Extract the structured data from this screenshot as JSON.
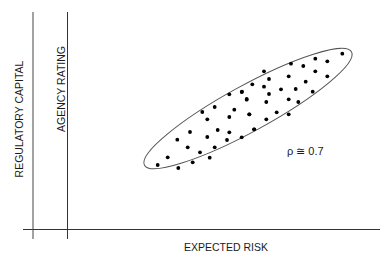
{
  "labels": {
    "x_axis": "EXPECTED RISK",
    "y_axis_1": "REGULATORY CAPITAL",
    "y_axis_2": "AGENCY RATING",
    "correlation": "ρ ≅ 0.7"
  },
  "colors": {
    "line": "#333333",
    "dot": "#000000",
    "ellipse": "#555555"
  },
  "points": [
    [
      157.7,
      165
    ],
    [
      167.7,
      157.3
    ],
    [
      178.3,
      168
    ],
    [
      192.7,
      162.3
    ],
    [
      177.3,
      139.7
    ],
    [
      187.7,
      147.3
    ],
    [
      190,
      132
    ],
    [
      200,
      152.3
    ],
    [
      209.7,
      157.7
    ],
    [
      214.7,
      147.3
    ],
    [
      207.3,
      137
    ],
    [
      202.3,
      112
    ],
    [
      207.3,
      119.3
    ],
    [
      214.7,
      107
    ],
    [
      217.7,
      130
    ],
    [
      227,
      140
    ],
    [
      229.3,
      132.3
    ],
    [
      229.3,
      117
    ],
    [
      234.3,
      109.7
    ],
    [
      229.3,
      94.3
    ],
    [
      241.7,
      92
    ],
    [
      246.7,
      99.7
    ],
    [
      249.3,
      114.3
    ],
    [
      241.7,
      137.3
    ],
    [
      254,
      129.3
    ],
    [
      342.3,
      53.7
    ],
    [
      327.3,
      61.3
    ],
    [
      315.3,
      58.7
    ],
    [
      303.3,
      66
    ],
    [
      291,
      63.7
    ],
    [
      315.3,
      71.3
    ],
    [
      327.3,
      76.3
    ],
    [
      264,
      71.3
    ],
    [
      269,
      79
    ],
    [
      288.7,
      76.3
    ],
    [
      305.7,
      81.7
    ],
    [
      252.3,
      84.3
    ],
    [
      242,
      91.7
    ],
    [
      264,
      86.7
    ],
    [
      281,
      89.3
    ],
    [
      295.7,
      89
    ],
    [
      312.7,
      91.7
    ],
    [
      269,
      94
    ],
    [
      246.7,
      99
    ],
    [
      266.3,
      102
    ],
    [
      288.7,
      99.3
    ],
    [
      298.3,
      102
    ],
    [
      249.3,
      114.3
    ],
    [
      276.7,
      112.3
    ],
    [
      288.7,
      114.3
    ],
    [
      266.3,
      119.3
    ],
    [
      254.3,
      129.3
    ]
  ]
}
